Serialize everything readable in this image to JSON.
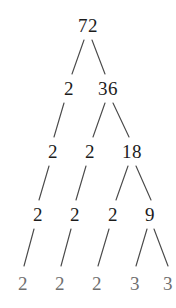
{
  "diagram": {
    "type": "factor-tree",
    "background_color": "#ffffff",
    "node_color": "#1c1c1c",
    "leaf_color": "#6f6f6f",
    "edge_color": "#4a4a4a",
    "root_value": "72",
    "prime_factorization": "2 x 2 x 2 x 3 x 3",
    "levels": [
      {
        "index": 0,
        "nodes": [
          {
            "id": "n72",
            "label": "72",
            "x": 88,
            "y": 25,
            "leaf": false
          }
        ]
      },
      {
        "index": 1,
        "nodes": [
          {
            "id": "n2a",
            "label": "2",
            "x": 69,
            "y": 88,
            "leaf": false
          },
          {
            "id": "n36",
            "label": "36",
            "x": 108,
            "y": 88,
            "leaf": false
          }
        ]
      },
      {
        "index": 2,
        "nodes": [
          {
            "id": "n2b",
            "label": "2",
            "x": 53,
            "y": 151,
            "leaf": false
          },
          {
            "id": "n2c",
            "label": "2",
            "x": 90,
            "y": 151,
            "leaf": false
          },
          {
            "id": "n18",
            "label": "18",
            "x": 132,
            "y": 151,
            "leaf": false
          }
        ]
      },
      {
        "index": 3,
        "nodes": [
          {
            "id": "n2d",
            "label": "2",
            "x": 38,
            "y": 214,
            "leaf": false
          },
          {
            "id": "n2e",
            "label": "2",
            "x": 75,
            "y": 214,
            "leaf": false
          },
          {
            "id": "n2f",
            "label": "2",
            "x": 113,
            "y": 214,
            "leaf": false
          },
          {
            "id": "n9",
            "label": "9",
            "x": 150,
            "y": 214,
            "leaf": false
          }
        ]
      },
      {
        "index": 4,
        "nodes": [
          {
            "id": "n2g",
            "label": "2",
            "x": 23,
            "y": 283,
            "leaf": true
          },
          {
            "id": "n2h",
            "label": "2",
            "x": 60,
            "y": 283,
            "leaf": true
          },
          {
            "id": "n2i",
            "label": "2",
            "x": 97,
            "y": 283,
            "leaf": true
          },
          {
            "id": "n3a",
            "label": "3",
            "x": 135,
            "y": 283,
            "leaf": true
          },
          {
            "id": "n3b",
            "label": "3",
            "x": 168,
            "y": 283,
            "leaf": true
          }
        ]
      }
    ],
    "edges": [
      {
        "id": "e1",
        "from": "n72",
        "to": "n2a",
        "x1": 84,
        "y1": 40,
        "x2": 72,
        "y2": 74
      },
      {
        "id": "e2",
        "from": "n72",
        "to": "n36",
        "x1": 92,
        "y1": 40,
        "x2": 105,
        "y2": 74
      },
      {
        "id": "e3",
        "from": "n2a",
        "to": "n2b",
        "x1": 64,
        "y1": 103,
        "x2": 54,
        "y2": 137
      },
      {
        "id": "e4",
        "from": "n36",
        "to": "n2c",
        "x1": 105,
        "y1": 103,
        "x2": 93,
        "y2": 137
      },
      {
        "id": "e5",
        "from": "n36",
        "to": "n18",
        "x1": 113,
        "y1": 103,
        "x2": 129,
        "y2": 137
      },
      {
        "id": "e6",
        "from": "n2b",
        "to": "n2d",
        "x1": 49,
        "y1": 166,
        "x2": 39,
        "y2": 200
      },
      {
        "id": "e7",
        "from": "n2c",
        "to": "n2e",
        "x1": 86,
        "y1": 166,
        "x2": 76,
        "y2": 200
      },
      {
        "id": "e8",
        "from": "n18",
        "to": "n2f",
        "x1": 128,
        "y1": 166,
        "x2": 116,
        "y2": 200
      },
      {
        "id": "e9",
        "from": "n18",
        "to": "n9",
        "x1": 136,
        "y1": 166,
        "x2": 151,
        "y2": 200
      },
      {
        "id": "e10",
        "from": "n2d",
        "to": "n2g",
        "x1": 34,
        "y1": 229,
        "x2": 24,
        "y2": 266
      },
      {
        "id": "e11",
        "from": "n2e",
        "to": "n2h",
        "x1": 71,
        "y1": 229,
        "x2": 61,
        "y2": 266
      },
      {
        "id": "e12",
        "from": "n2f",
        "to": "n2i",
        "x1": 109,
        "y1": 229,
        "x2": 98,
        "y2": 266
      },
      {
        "id": "e13",
        "from": "n9",
        "to": "n3a",
        "x1": 147,
        "y1": 229,
        "x2": 136,
        "y2": 266
      },
      {
        "id": "e14",
        "from": "n9",
        "to": "n3b",
        "x1": 154,
        "y1": 229,
        "x2": 168,
        "y2": 266
      }
    ]
  }
}
